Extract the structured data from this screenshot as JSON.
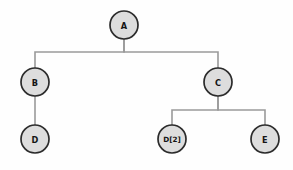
{
  "diagram": {
    "type": "node-link-tree",
    "canvas": {
      "width": 293,
      "height": 170,
      "background": "#fefefe"
    },
    "style": {
      "node_fill": "#dddddd",
      "node_stroke": "#2b2b2b",
      "edge_stroke": "#9a9a9a",
      "label_color": "#141414",
      "node_radius": 14
    },
    "nodes": [
      {
        "id": "A",
        "label": "A",
        "cx": 124,
        "cy": 25,
        "r": 14,
        "size": "normal"
      },
      {
        "id": "B",
        "label": "B",
        "cx": 35,
        "cy": 82,
        "r": 14,
        "size": "normal"
      },
      {
        "id": "C",
        "label": "C",
        "cx": 218,
        "cy": 82,
        "r": 14,
        "size": "normal"
      },
      {
        "id": "D",
        "label": "D",
        "cx": 35,
        "cy": 139,
        "r": 14,
        "size": "normal"
      },
      {
        "id": "D2",
        "label": "D[2]",
        "cx": 172,
        "cy": 139,
        "r": 14,
        "size": "small"
      },
      {
        "id": "E",
        "label": "E",
        "cx": 265,
        "cy": 139,
        "r": 14,
        "size": "normal"
      }
    ],
    "edges": [
      {
        "from": "A",
        "to": "B",
        "path": "M124,39 L124,52 L35,52 L35,68"
      },
      {
        "from": "A",
        "to": "C",
        "path": "M124,39 L124,52 L218,52 L218,68"
      },
      {
        "from": "B",
        "to": "D",
        "path": "M35,96 L35,125"
      },
      {
        "from": "C",
        "to": "D2",
        "path": "M218,96 L218,110 L172,110 L172,125"
      },
      {
        "from": "C",
        "to": "E",
        "path": "M218,96 L218,110 L265,110 L265,125"
      }
    ]
  }
}
